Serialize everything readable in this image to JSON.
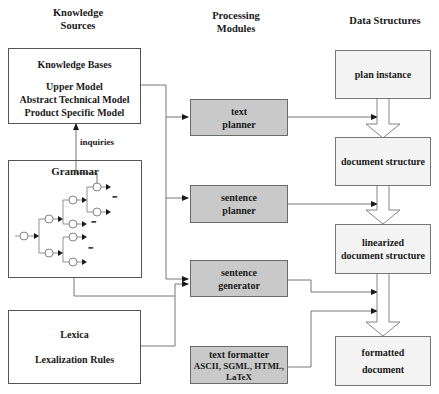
{
  "columns": {
    "knowledge_sources": [
      "Knowledge",
      "Sources"
    ],
    "processing_modules": [
      "Processing",
      "Modules"
    ],
    "data_structures": "Data Structures"
  },
  "knowledge_sources": {
    "knowledge_bases": {
      "title": "Knowledge Bases",
      "items": [
        "Upper Model",
        "Abstract Technical Model",
        "Product Specific Model"
      ]
    },
    "grammar": {
      "title": "Grammar",
      "ellipsis": "•••"
    },
    "lexica": {
      "lines": [
        "Lexica",
        "Lexalization Rules"
      ]
    },
    "inquiries_label": "inquiries"
  },
  "processing_modules": {
    "text_planner": [
      "text",
      "planner"
    ],
    "sentence_planner": [
      "sentence",
      "planner"
    ],
    "sentence_generator": [
      "sentence",
      "generator"
    ],
    "text_formatter": [
      "text formatter",
      "ASCII, SGML, HTML,",
      "LaTeX"
    ]
  },
  "data_structures": {
    "plan_instance": "plan instance",
    "document_structure": "document structure",
    "linearized_document_structure": [
      "linearized",
      "document structure"
    ],
    "formatted_document": [
      "formatted",
      "document"
    ]
  },
  "colors": {
    "module_fill": "#c9c9c9",
    "data_structure_fill": "#f4f4f4",
    "source_fill": "#ffffff",
    "line": "#555555"
  }
}
